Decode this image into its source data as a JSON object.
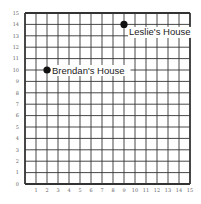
{
  "chart_data": {
    "type": "scatter",
    "title": "",
    "xlabel": "",
    "ylabel": "",
    "xlim": [
      0,
      15
    ],
    "ylim": [
      0,
      15
    ],
    "grid": true,
    "x_ticks": [
      1,
      2,
      3,
      4,
      5,
      6,
      7,
      8,
      9,
      10,
      11,
      12,
      13,
      14,
      15
    ],
    "y_ticks": [
      0,
      1,
      2,
      3,
      4,
      5,
      6,
      7,
      8,
      9,
      10,
      11,
      12,
      13,
      14,
      15
    ],
    "points": [
      {
        "label": "Brendan's House",
        "x": 2,
        "y": 10
      },
      {
        "label": "Leslie's House",
        "x": 9,
        "y": 14
      }
    ]
  },
  "style": {
    "grid_color": "#333333",
    "point_color": "#111111"
  }
}
